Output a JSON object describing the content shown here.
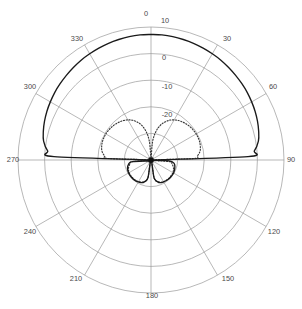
{
  "chart_data": {
    "type": "line",
    "title": "",
    "subtitle": "",
    "xlabel": "",
    "ylabel": "",
    "projection": "polar",
    "angle_unit": "degrees",
    "radial_unit": "dB",
    "grid": true,
    "legend_position": "none",
    "angle_ticks": [
      0,
      30,
      60,
      90,
      120,
      150,
      180,
      210,
      240,
      270,
      300,
      330
    ],
    "angle_tick_labels": [
      "0",
      "30",
      "60",
      "90",
      "120",
      "150",
      "180",
      "210",
      "240",
      "270",
      "300",
      "330"
    ],
    "radial_ticks": [
      10,
      0,
      -10,
      -20
    ],
    "radial_tick_labels": [
      "10",
      "0",
      "-10",
      "-20"
    ],
    "rlim": [
      -40,
      10
    ],
    "angle_zero_location": "N",
    "angle_direction": "clockwise",
    "series": [
      {
        "name": "solid-pattern",
        "style": "solid",
        "color": "#1a1a1a",
        "angles": [
          0,
          5,
          10,
          15,
          20,
          25,
          30,
          35,
          40,
          45,
          50,
          55,
          60,
          65,
          70,
          75,
          80,
          85,
          88,
          90,
          92,
          95,
          100,
          110,
          120,
          130,
          140,
          150,
          160,
          170,
          180,
          190,
          200,
          210,
          220,
          230,
          240,
          250,
          260,
          265,
          270,
          272,
          275,
          280,
          285,
          290,
          295,
          300,
          305,
          310,
          315,
          320,
          325,
          330,
          335,
          340,
          345,
          350,
          355,
          360
        ],
        "values": [
          7.2,
          7.2,
          7.1,
          6.9,
          6.7,
          6.4,
          6.1,
          5.8,
          5.4,
          5.0,
          4.6,
          4.2,
          3.7,
          3.2,
          2.6,
          1.9,
          1.0,
          -1.0,
          -3.5,
          -40,
          -34,
          -32,
          -31,
          -30.5,
          -30.2,
          -30.2,
          -30.3,
          -30.5,
          -31,
          -33,
          -40,
          -33,
          -31,
          -30.5,
          -30.2,
          -30.2,
          -30.3,
          -30.6,
          -31.5,
          -33,
          -40,
          -3.5,
          -1.0,
          1.0,
          1.9,
          2.6,
          3.2,
          3.7,
          4.2,
          4.6,
          5.0,
          5.4,
          5.8,
          6.1,
          6.4,
          6.7,
          6.9,
          7.1,
          7.2,
          7.2
        ]
      },
      {
        "name": "dotted-pattern",
        "style": "dotted",
        "color": "#3a3a3a",
        "angles": [
          0,
          5,
          10,
          15,
          20,
          25,
          30,
          35,
          40,
          45,
          50,
          55,
          60,
          65,
          70,
          75,
          80,
          85,
          88,
          90,
          95,
          100,
          110,
          120,
          130,
          140,
          150,
          160,
          170,
          180,
          190,
          200,
          210,
          220,
          230,
          240,
          250,
          260,
          265,
          270,
          272,
          275,
          280,
          285,
          290,
          295,
          300,
          305,
          310,
          315,
          320,
          325,
          330,
          335,
          340,
          345,
          350,
          355,
          360
        ],
        "values": [
          -40,
          -33,
          -29,
          -26.5,
          -24.8,
          -23.5,
          -22.6,
          -21.9,
          -21.4,
          -21.0,
          -20.7,
          -20.5,
          -20.4,
          -20.4,
          -20.5,
          -20.8,
          -21.3,
          -22.5,
          -24,
          -40,
          -33,
          -32,
          -31,
          -30.5,
          -30.4,
          -30.4,
          -30.6,
          -31.2,
          -33,
          -40,
          -33,
          -31.2,
          -30.6,
          -30.4,
          -30.4,
          -30.5,
          -31,
          -32,
          -33,
          -40,
          -24,
          -22.5,
          -21.3,
          -20.8,
          -20.5,
          -20.4,
          -20.4,
          -20.5,
          -20.7,
          -21.0,
          -21.4,
          -21.9,
          -22.6,
          -23.5,
          -24.8,
          -26.5,
          -29,
          -33,
          -40
        ]
      }
    ],
    "annotations": [],
    "colors": {
      "grid": "#9a9a9a",
      "solid_series": "#1a1a1a",
      "dotted_series": "#3a3a3a",
      "label_text": "#4a4a4a",
      "background": "#ffffff"
    }
  },
  "labels": {
    "a0": "0",
    "a30": "30",
    "a60": "60",
    "a90": "90",
    "a120": "120",
    "a150": "150",
    "a180": "180",
    "a210": "210",
    "a240": "240",
    "a270": "270",
    "a300": "300",
    "a330": "330",
    "r10": "10",
    "r0": "0",
    "rm10": "-10",
    "rm20": "-20"
  }
}
